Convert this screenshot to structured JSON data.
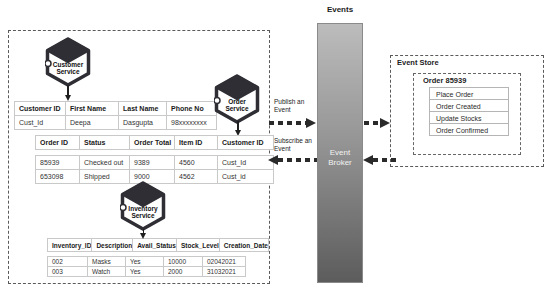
{
  "events_label": "Events",
  "broker": {
    "line1": "Event",
    "line2": "Broker"
  },
  "arrows": {
    "publish_line1": "Publish an",
    "publish_line2": "Event",
    "subscribe_line1": "Subscribe an",
    "subscribe_line2": "Event"
  },
  "services": {
    "customer": {
      "line1": "Customer",
      "line2": "Service"
    },
    "order": {
      "line1": "Order",
      "line2": "Service"
    },
    "inventory": {
      "line1": "Inventory",
      "line2": "Service"
    }
  },
  "customer_table": {
    "headers": [
      "Customer ID",
      "First Name",
      "Last Name",
      "Phone No"
    ],
    "rows": [
      [
        "Cust_Id",
        "Deepa",
        "Dasgupta",
        "98xxxxxxxx"
      ]
    ]
  },
  "order_table": {
    "headers": [
      "Order ID",
      "Status",
      "Order Total",
      "Item ID",
      "Customer ID"
    ],
    "rows": [
      [
        "85939",
        "Checked out",
        "9389",
        "4560",
        "Cust_Id"
      ],
      [
        "653098",
        "Shipped",
        "9000",
        "4562",
        "Cust_id"
      ]
    ]
  },
  "inventory_table": {
    "headers": [
      "Inventory_ID",
      "Description",
      "Avail_Status",
      "Stock_Level",
      "Creation_Date"
    ],
    "rows": [
      [
        "002",
        "Masks",
        "Yes",
        "10000",
        "02042021"
      ],
      [
        "003",
        "Watch",
        "Yes",
        "2000",
        "31032021"
      ]
    ]
  },
  "event_store": {
    "title": "Event Store",
    "order_title": "Order 85939",
    "items": [
      "Place Order",
      "Order Created",
      "Update Stocks",
      "Order Confirmed"
    ]
  },
  "colors": {
    "hexagon": "#2e2e34",
    "broker_top": "#bcbcbc",
    "broker_bottom": "#5c5c5c",
    "arrow": "#2a2a2a",
    "table_border": "#c9c9c9"
  }
}
